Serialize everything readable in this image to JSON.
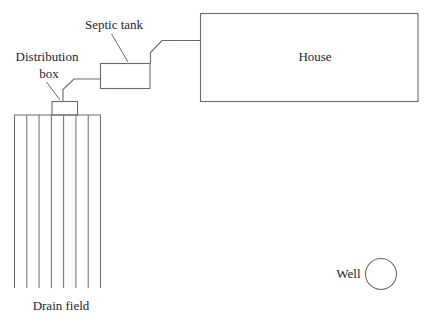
{
  "labels": {
    "septic_tank": "Septic tank",
    "distribution_box_line1": "Distribution",
    "distribution_box_line2": "box",
    "house": "House",
    "drain_field": "Drain field",
    "well": "Well"
  },
  "drain_field": {
    "line_count": 8
  },
  "colors": {
    "line": "#6a6a72",
    "text": "#23232f",
    "background": "#ffffff"
  }
}
